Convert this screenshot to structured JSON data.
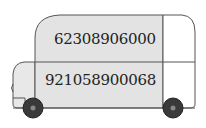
{
  "figure": {
    "type": "bus-illustration",
    "numbers": {
      "top": "62308906000",
      "bottom": "921058900068"
    },
    "colors": {
      "body_fill": "#e3e3e3",
      "window_fill": "#ffffff",
      "outline": "#555555",
      "wheel": "#3a3a3a",
      "hub": "#888888"
    }
  }
}
